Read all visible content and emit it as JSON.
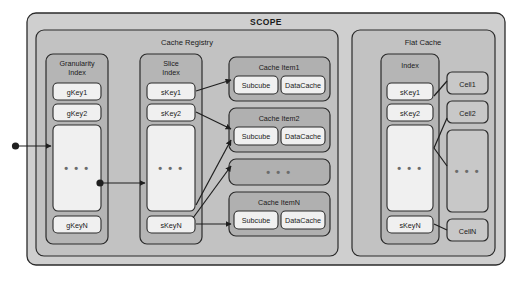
{
  "diagram": {
    "title": "SCOPE",
    "outer": {
      "label": "SCOPE"
    },
    "groups": [
      {
        "id": "cache_registry",
        "label": "Cache Registry"
      },
      {
        "id": "flat_cache",
        "label": "Flat Cache"
      }
    ],
    "granularity_index": {
      "title_line1": "Granularity",
      "title_line2": "Index",
      "keys": [
        "gKey1",
        "gKey2"
      ],
      "ellipsis": "• • •",
      "last_key": "gKeyN"
    },
    "slice_index": {
      "title_line1": "Slice",
      "title_line2": "Index",
      "keys": [
        "sKey1",
        "sKey2"
      ],
      "ellipsis": "• • •",
      "last_key": "sKeyN"
    },
    "cache_items": [
      {
        "title": "Cache Item1",
        "left": "Subcube",
        "right": "DataCache"
      },
      {
        "title": "Cache Item2",
        "left": "Subcube",
        "right": "DataCache"
      },
      {
        "title": "",
        "left": "",
        "right": "",
        "ellipsis": "• • •"
      },
      {
        "title": "Cache ItemN",
        "left": "Subcube",
        "right": "DataCache"
      }
    ],
    "flat_index": {
      "title": "Index",
      "keys": [
        "sKey1",
        "sKey2"
      ],
      "ellipsis": "• • •",
      "last_key": "sKeyN"
    },
    "cells": [
      {
        "label": "Cell1"
      },
      {
        "label": "Cell2"
      },
      {
        "label": "",
        "ellipsis": "• • •"
      },
      {
        "label": "CellN"
      }
    ],
    "colors": {
      "page_background": "#ffffff",
      "scope_fill": "#cfcfcf",
      "group_fill": "#c2c2c2",
      "panel_fill": "#b5b5b5",
      "item_fill": "#b0b0b0",
      "box_fill": "#f0f0f0",
      "cell_fill": "#c8c8c8",
      "stroke": "#2b2b2b",
      "text": "#1a1a1a",
      "dots": "#6b6b6b"
    }
  }
}
